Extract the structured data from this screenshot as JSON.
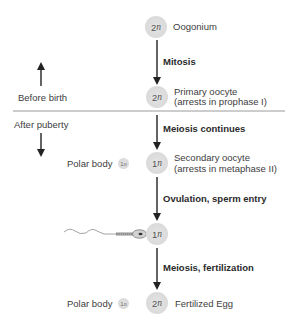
{
  "diagram": {
    "colors": {
      "cell_fill": "#dadada",
      "arrow": "#222222",
      "divider": "#9a9a9a",
      "text": "#3d3d3d"
    },
    "timeline": {
      "before_label": "Before birth",
      "after_label": "After puberty"
    },
    "stages": [
      {
        "ploidy_num": "2",
        "ploidy_n": "n",
        "label_line1": "Oogonium",
        "label_line2": ""
      },
      {
        "ploidy_num": "2",
        "ploidy_n": "n",
        "label_line1": "Primary oocyte",
        "label_line2": "(arrests in prophase I)"
      },
      {
        "ploidy_num": "1",
        "ploidy_n": "n",
        "label_line1": "Secondary oocyte",
        "label_line2": "(arrests in metaphase II)"
      },
      {
        "ploidy_num": "1",
        "ploidy_n": "n",
        "label_line1": "",
        "label_line2": ""
      },
      {
        "ploidy_num": "2",
        "ploidy_n": "n",
        "label_line1": "Fertilized Egg",
        "label_line2": ""
      }
    ],
    "transitions": [
      {
        "label": "Mitosis"
      },
      {
        "label": "Meiosis continues"
      },
      {
        "label": "Ovulation, sperm entry"
      },
      {
        "label": "Meiosis, fertilization"
      }
    ],
    "polar_bodies": [
      {
        "label": "Polar body",
        "ploidy_num": "1",
        "ploidy_n": "n"
      },
      {
        "label": "Polar body",
        "ploidy_num": "1",
        "ploidy_n": "n"
      }
    ]
  }
}
